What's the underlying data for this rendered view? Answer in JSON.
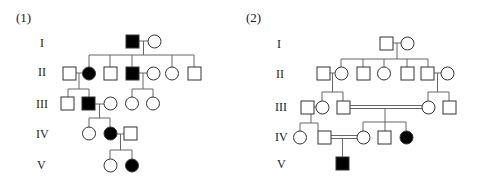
{
  "panels": [
    {
      "label": "(1)",
      "generations": [
        "I",
        "II",
        "III",
        "IV",
        "V"
      ],
      "legend_note": "filled = affected, square = male, circle = female"
    },
    {
      "label": "(2)",
      "generations": [
        "I",
        "II",
        "III",
        "IV",
        "V"
      ]
    }
  ],
  "colors": {
    "line": "#666666",
    "affected": "#000000",
    "unaffected_fill": "#ffffff",
    "outline": "#333333"
  }
}
